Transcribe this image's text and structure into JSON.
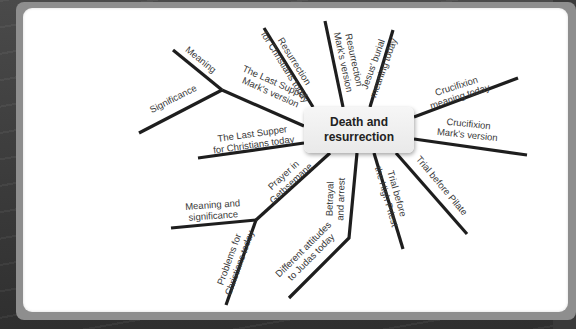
{
  "diagram": {
    "central_topic": {
      "line1": "Death and",
      "line2": "resurrection"
    },
    "colors": {
      "line": "#1e1e1e",
      "panel": "#ffffff",
      "frame": "#8e8e8e",
      "node_fill": "#eeeeee",
      "text": "#3a3a3a"
    },
    "branches": [
      {
        "id": "last-supper-marks-version",
        "label": [
          "The Last Supper",
          "Mark's version"
        ],
        "sub_branches": [
          {
            "id": "meaning",
            "label": [
              "Meaning"
            ]
          },
          {
            "id": "significance",
            "label": [
              "Significance"
            ]
          }
        ]
      },
      {
        "id": "last-supper-christians-today",
        "label": [
          "The Last Supper",
          "for Christians today"
        ]
      },
      {
        "id": "resurrection-christians-today",
        "label": [
          "Resurrection",
          "for Christians today"
        ]
      },
      {
        "id": "resurrection-marks-version",
        "label": [
          "Resurrection",
          "Mark's version"
        ]
      },
      {
        "id": "jesus-burial-meaning-today",
        "label": [
          "Jesus' burial",
          "meaning today"
        ]
      },
      {
        "id": "crucifixion-meaning-today",
        "label": [
          "Crucifixion",
          "meaning today"
        ]
      },
      {
        "id": "crucifixion-marks-version",
        "label": [
          "Crucifixion",
          "Mark's version"
        ]
      },
      {
        "id": "trial-before-pilate",
        "label": [
          "Trial before Pilate"
        ]
      },
      {
        "id": "trial-before-high-priest",
        "label": [
          "Trial before",
          "the High Priest"
        ]
      },
      {
        "id": "betrayal-and-arrest",
        "label": [
          "Betrayal",
          "and arrest"
        ],
        "sub_branches": [
          {
            "id": "different-attitudes-judas",
            "label": [
              "Different attitudes",
              "to Judas today"
            ]
          }
        ]
      },
      {
        "id": "prayer-in-gethsemane",
        "label": [
          "Prayer in",
          "Gethsemane"
        ],
        "sub_branches": [
          {
            "id": "meaning-and-significance",
            "label": [
              "Meaning and",
              "significance"
            ]
          },
          {
            "id": "problems-christians-today",
            "label": [
              "Problems for",
              "Christians today"
            ]
          }
        ]
      }
    ]
  }
}
